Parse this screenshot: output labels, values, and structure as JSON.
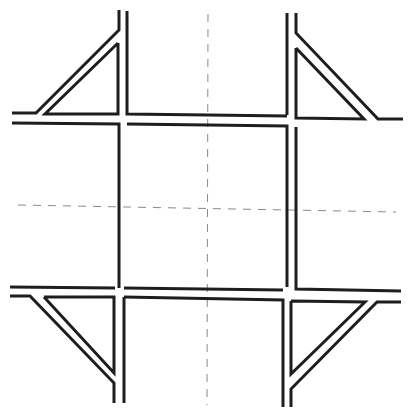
{
  "diagram": {
    "type": "road-network-plan",
    "width": 416,
    "height": 418,
    "colors": {
      "background": "#ffffff",
      "road_edge": "#1e1e1e",
      "centerline": "#8a8a8a"
    },
    "stroke": {
      "road_edge_width": 3,
      "centerline_width": 1,
      "centerline_dash": "8 7"
    },
    "centerlines": [
      {
        "id": "vertical-centerline",
        "x1": 208,
        "y1": 14,
        "x2": 207,
        "y2": 405
      },
      {
        "id": "horizontal-centerline",
        "x1": 18,
        "y1": 205,
        "x2": 396,
        "y2": 212
      }
    ],
    "road_edges": [
      {
        "id": "nw-outer",
        "points": "119,10 119,30 36,113 12,113"
      },
      {
        "id": "nw-inner-triangle",
        "points": "118,43 118,114 45,114 118,43"
      },
      {
        "id": "north-left-east",
        "points": "127,11 127,114 208,115 287,116"
      },
      {
        "id": "ne-outer",
        "points": "287,13 287,115"
      },
      {
        "id": "ne-diagonal",
        "points": "296,13 296,33 378,119 403,119"
      },
      {
        "id": "ne-inner-triangle",
        "points": "296,48 296,118 364,119 296,48"
      },
      {
        "id": "nw-lower-horizontal",
        "points": "12,123 119,124 119,288"
      },
      {
        "id": "center-upper-lower",
        "points": "127,124 287,126 287,287"
      },
      {
        "id": "ne-lower",
        "points": "296,127 296,289 401,291"
      },
      {
        "id": "sw-upper",
        "points": "10,287 115,288"
      },
      {
        "id": "center-bottom-upper",
        "points": "124,288 283,290"
      },
      {
        "id": "sw-outer",
        "points": "10,296 30,296 114,383 114,403"
      },
      {
        "id": "sw-inner-triangle",
        "points": "44,297 114,297 114,373 44,297"
      },
      {
        "id": "south-left-right",
        "points": "124,297 124,403"
      },
      {
        "id": "center-bottom-lower",
        "points": "124,297 283,300 283,407"
      },
      {
        "id": "se-inner-triangle",
        "points": "291,301 365,302 291,374 291,301"
      },
      {
        "id": "se-outer",
        "points": "401,302 377,302 291,389 291,407"
      }
    ]
  }
}
